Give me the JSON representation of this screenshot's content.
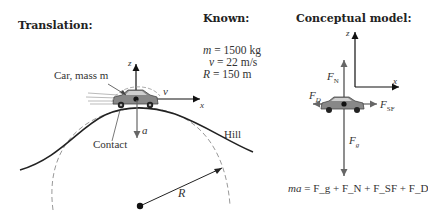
{
  "sections": {
    "translation": {
      "title": "Translation:"
    },
    "known": {
      "title": "Known:"
    },
    "model": {
      "title": "Conceptual model:"
    }
  },
  "translation_labels": {
    "car": "Car, mass m",
    "contact": "Contact",
    "hill": "Hill",
    "radius": "R",
    "axis_z": "z",
    "axis_x": "x",
    "velocity": "v",
    "acceleration": "a"
  },
  "known_values": [
    {
      "symbol": "m",
      "eq": " = 1500 kg"
    },
    {
      "symbol": "v",
      "eq": " = 22 m/s"
    },
    {
      "symbol": "R",
      "eq": " = 150 m"
    }
  ],
  "model_labels": {
    "axis_z": "z",
    "axis_x": "x",
    "normal": "F",
    "normal_sub": "N",
    "drag": "F",
    "drag_sub": "D",
    "static_friction": "F",
    "static_friction_sub": "SF",
    "gravity": "F",
    "gravity_sub": "g"
  },
  "equation": {
    "lhs": "ma",
    "rhs": "= F_g + F_N + F_SF + F_D"
  },
  "colors": {
    "ink": "#222222",
    "gray": "#777777",
    "dash": "#999999",
    "arrow_gray": "#666666"
  }
}
